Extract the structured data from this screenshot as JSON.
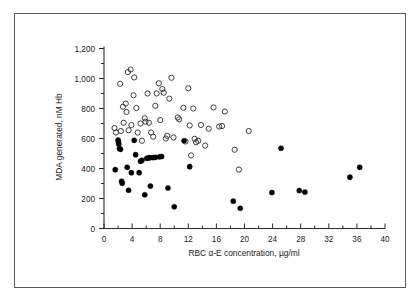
{
  "figure": {
    "border_color": "#5a5a5a",
    "background": "#ffffff"
  },
  "chart_data": {
    "type": "scatter",
    "title": "",
    "xlabel": "RBC α-E concentration, µg/ml",
    "ylabel": "MDA generated, nM Hb",
    "xlim": [
      0,
      40
    ],
    "ylim": [
      0,
      1200
    ],
    "xticks": [
      0,
      4,
      8,
      12,
      16,
      20,
      24,
      28,
      32,
      36,
      40
    ],
    "xticklabels": [
      "0",
      "4",
      "8",
      "12",
      "16",
      "20",
      "24",
      "28",
      "32",
      "36",
      "40"
    ],
    "xminor_step": 2,
    "yticks": [
      0,
      200,
      400,
      600,
      800,
      1000,
      1200
    ],
    "yticklabels": [
      "0",
      "200",
      "400",
      "600",
      "800",
      "1,000",
      "1,200"
    ],
    "yminor_step": 100,
    "grid": false,
    "legend": null,
    "marker_radius_px": 2.6,
    "series": [
      {
        "name": "open-circles",
        "marker": "open-circle",
        "color": "#2b2b2b",
        "points": [
          [
            1.5,
            670
          ],
          [
            1.7,
            640
          ],
          [
            2.3,
            965
          ],
          [
            2.4,
            650
          ],
          [
            2.7,
            812
          ],
          [
            2.8,
            705
          ],
          [
            3.1,
            833
          ],
          [
            3.2,
            777
          ],
          [
            3.4,
            1043
          ],
          [
            3.5,
            655
          ],
          [
            3.8,
            1060
          ],
          [
            3.9,
            690
          ],
          [
            4.2,
            888
          ],
          [
            4.3,
            1007
          ],
          [
            4.6,
            803
          ],
          [
            4.8,
            640
          ],
          [
            5.2,
            700
          ],
          [
            5.4,
            585
          ],
          [
            5.8,
            735
          ],
          [
            5.9,
            712
          ],
          [
            6.2,
            900
          ],
          [
            6.4,
            705
          ],
          [
            6.7,
            640
          ],
          [
            7.0,
            612
          ],
          [
            7.3,
            818
          ],
          [
            7.5,
            900
          ],
          [
            7.8,
            968
          ],
          [
            8.0,
            723
          ],
          [
            8.3,
            930
          ],
          [
            8.5,
            905
          ],
          [
            8.8,
            600
          ],
          [
            9.0,
            618
          ],
          [
            9.3,
            866
          ],
          [
            9.6,
            1005
          ],
          [
            9.9,
            607
          ],
          [
            10.5,
            740
          ],
          [
            10.7,
            728
          ],
          [
            11.3,
            805
          ],
          [
            11.6,
            580
          ],
          [
            12.0,
            935
          ],
          [
            12.2,
            687
          ],
          [
            12.4,
            487
          ],
          [
            12.7,
            800
          ],
          [
            12.9,
            598
          ],
          [
            13.1,
            575
          ],
          [
            13.4,
            585
          ],
          [
            13.8,
            690
          ],
          [
            14.4,
            553
          ],
          [
            14.9,
            665
          ],
          [
            15.6,
            807
          ],
          [
            16.4,
            680
          ],
          [
            16.8,
            683
          ],
          [
            17.2,
            780
          ],
          [
            18.6,
            525
          ],
          [
            19.2,
            393
          ],
          [
            20.6,
            650
          ]
        ]
      },
      {
        "name": "filled-circles",
        "marker": "filled-circle",
        "color": "#000000",
        "points": [
          [
            1.6,
            392
          ],
          [
            2.0,
            590
          ],
          [
            2.05,
            577
          ],
          [
            2.1,
            563
          ],
          [
            2.2,
            533
          ],
          [
            2.35,
            528
          ],
          [
            2.5,
            315
          ],
          [
            2.6,
            302
          ],
          [
            3.3,
            408
          ],
          [
            3.5,
            255
          ],
          [
            3.9,
            372
          ],
          [
            4.3,
            588
          ],
          [
            4.5,
            492
          ],
          [
            5.0,
            372
          ],
          [
            5.2,
            448
          ],
          [
            5.4,
            455
          ],
          [
            5.8,
            225
          ],
          [
            6.1,
            468
          ],
          [
            6.3,
            470
          ],
          [
            6.5,
            472
          ],
          [
            6.6,
            283
          ],
          [
            7.0,
            473
          ],
          [
            7.3,
            474
          ],
          [
            7.9,
            478
          ],
          [
            8.2,
            480
          ],
          [
            9.1,
            270
          ],
          [
            10.0,
            145
          ],
          [
            11.4,
            585
          ],
          [
            12.2,
            412
          ],
          [
            18.4,
            182
          ],
          [
            19.4,
            135
          ],
          [
            23.9,
            240
          ],
          [
            25.2,
            535
          ],
          [
            27.8,
            253
          ],
          [
            28.6,
            243
          ],
          [
            35.0,
            342
          ],
          [
            36.4,
            408
          ]
        ]
      }
    ]
  }
}
